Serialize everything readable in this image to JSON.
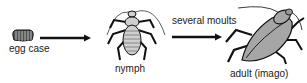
{
  "diagram": {
    "type": "life-cycle",
    "stages": [
      {
        "id": "egg-case",
        "label": "egg case"
      },
      {
        "id": "nymph",
        "label": "nymph"
      },
      {
        "id": "adult",
        "label": "adult (imago)"
      }
    ],
    "transitions": [
      {
        "from": "egg-case",
        "to": "nymph",
        "label": ""
      },
      {
        "from": "nymph",
        "to": "adult",
        "label": "several moults"
      }
    ],
    "colors": {
      "ink": "#111111",
      "egg_fill": "#555555",
      "nymph_fill": "#cfcfcf",
      "adult_fill": "#a6a6a6"
    }
  }
}
